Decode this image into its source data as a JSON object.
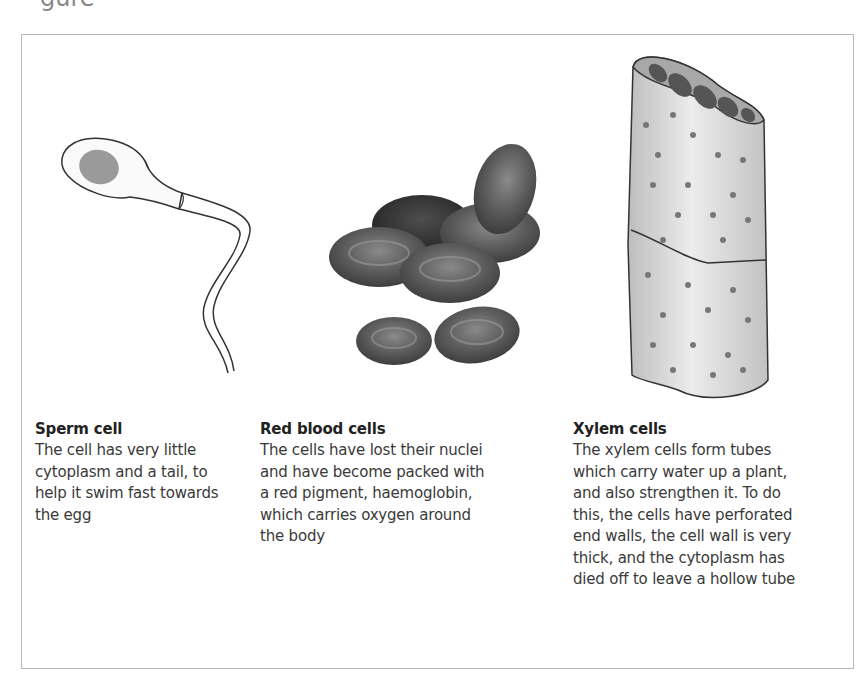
{
  "page": {
    "clipped_heading_fragment": "gure"
  },
  "figure": {
    "panels": [
      {
        "id": "sperm",
        "title": "Sperm cell",
        "description_lines": [
          "The cell has very little",
          "cytoplasm and a tail, to",
          "help it swim fast towards",
          "the egg"
        ],
        "illustration": "sperm-cell-illustration"
      },
      {
        "id": "rbc",
        "title": "Red blood cells",
        "description_lines": [
          "The cells have lost their nuclei",
          "and have become packed with",
          "a red pigment, haemoglobin,",
          "which carries oxygen around",
          "the body"
        ],
        "illustration": "red-blood-cells-illustration"
      },
      {
        "id": "xylem",
        "title": "Xylem cells",
        "description_lines": [
          "The xylem cells form tubes",
          "which carry water up a plant,",
          "and also strengthen it. To do",
          "this, the cells have perforated",
          "end walls, the cell wall is very",
          "thick, and the cytoplasm has",
          "died off to leave a hollow tube"
        ],
        "illustration": "xylem-cells-illustration"
      }
    ]
  }
}
